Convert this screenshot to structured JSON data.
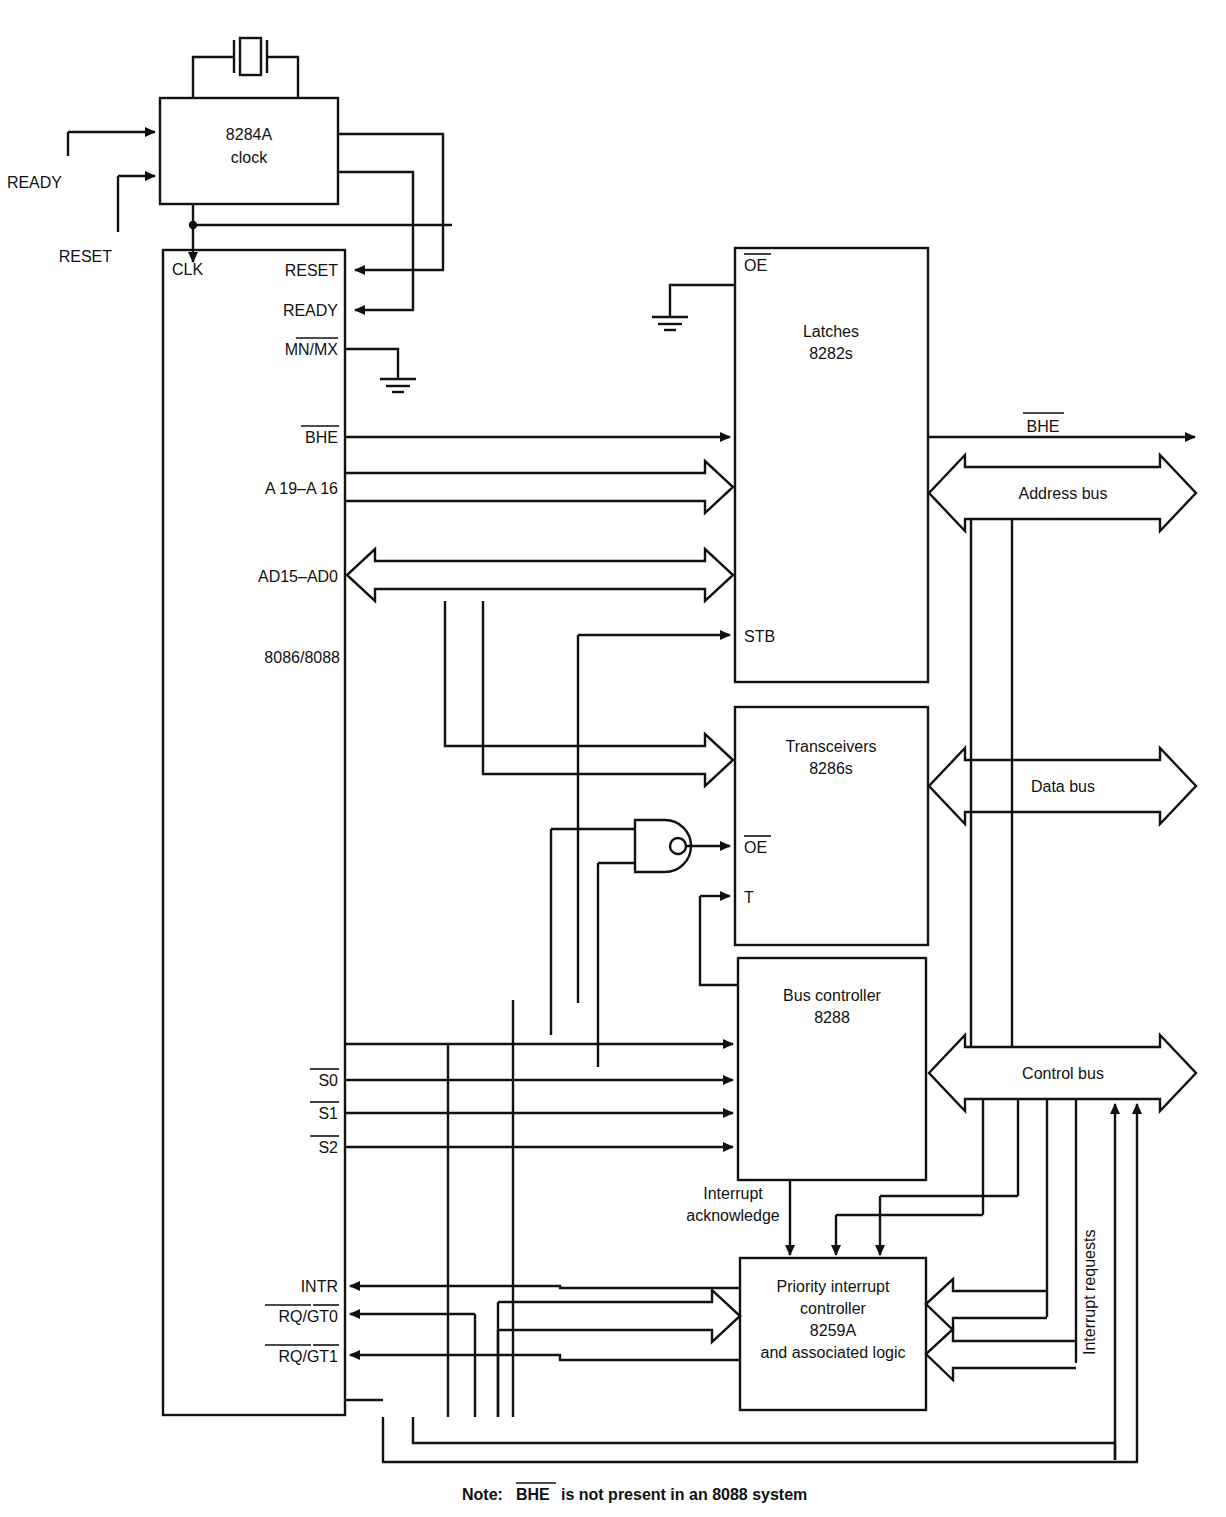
{
  "diagram": {
    "note": "Note:",
    "note_signal": "BHE",
    "note_rest": "is not present in an 8088 system",
    "line_color": "#111111",
    "background": "#ffffff"
  },
  "blocks": {
    "clock": {
      "line1": "8284A",
      "line2": "clock"
    },
    "cpu": {
      "label": "8086/8088"
    },
    "latches": {
      "line1": "Latches",
      "line2": "8282s"
    },
    "transceivers": {
      "line1": "Transceivers",
      "line2": "8286s"
    },
    "bus_controller": {
      "line1": "Bus controller",
      "line2": "8288"
    },
    "pic": {
      "line1": "Priority interrupt",
      "line2": "controller",
      "line3": "8259A",
      "line4": "and associated logic"
    }
  },
  "clock_inputs": [
    {
      "label": "READY"
    },
    {
      "label": "RESET"
    }
  ],
  "cpu_pins_left": [
    {
      "label": "CLK",
      "overbar": false
    },
    {
      "label": "S0",
      "overbar": true
    },
    {
      "label": "S1",
      "overbar": true
    },
    {
      "label": "S2",
      "overbar": true
    },
    {
      "label": "INTR",
      "overbar": false
    },
    {
      "label": "RQ/GT0",
      "overbar": true
    },
    {
      "label": "RQ/GT1",
      "overbar": true
    }
  ],
  "cpu_pins_right": [
    {
      "label": "RESET",
      "overbar": false
    },
    {
      "label": "READY",
      "overbar": false
    },
    {
      "label": "MN/MX",
      "overbar": "partial"
    },
    {
      "label": "BHE",
      "overbar": true
    },
    {
      "label": "A 19–A 16",
      "overbar": false
    },
    {
      "label": "AD15–AD0",
      "overbar": false
    }
  ],
  "latch_pins": [
    {
      "label": "OE",
      "overbar": true
    },
    {
      "label": "STB",
      "overbar": false
    }
  ],
  "transceiver_pins": [
    {
      "label": "OE",
      "overbar": true
    },
    {
      "label": "T",
      "overbar": false
    }
  ],
  "buses": [
    {
      "label": "BHE",
      "overbar": true,
      "kind": "single-arrow"
    },
    {
      "label": "Address bus",
      "overbar": false,
      "kind": "wide-bidirectional"
    },
    {
      "label": "Data bus",
      "overbar": false,
      "kind": "wide-bidirectional"
    },
    {
      "label": "Control bus",
      "overbar": false,
      "kind": "wide-bidirectional"
    }
  ],
  "annotations": [
    {
      "label_line1": "Interrupt",
      "label_line2": "acknowledge",
      "orientation": "horizontal"
    },
    {
      "label": "Interrupt requests",
      "orientation": "vertical"
    }
  ]
}
